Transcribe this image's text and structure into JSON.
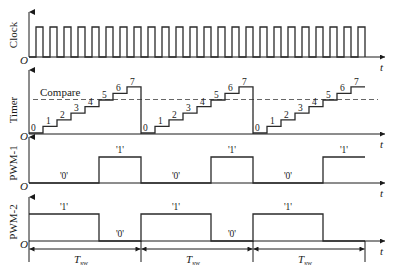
{
  "diagram": {
    "colors": {
      "line": "#2a2a2a",
      "axis": "#1a1a1a",
      "dashed": "#555555",
      "background": "#ffffff"
    },
    "time_axis_label": "t",
    "origin_label": "O",
    "panels": {
      "clock": {
        "ylabel": "Clock",
        "pulse_count": 24
      },
      "timer": {
        "ylabel": "Timer",
        "compare_label": "Compare",
        "step_values": [
          "0",
          "1",
          "2",
          "3",
          "4",
          "5",
          "6",
          "7"
        ],
        "compare_threshold": 4.5
      },
      "pwm1": {
        "ylabel": "PWM-1",
        "levels": [
          "'0'",
          "'1'",
          "'0'",
          "'1'",
          "'0'",
          "'1'"
        ]
      },
      "pwm2": {
        "ylabel": "PWM-2",
        "levels": [
          "'1'",
          "'0'",
          "'1'",
          "'0'",
          "'1'"
        ]
      }
    },
    "period": {
      "label_main": "T",
      "label_sub": "sw",
      "count": 3
    }
  }
}
